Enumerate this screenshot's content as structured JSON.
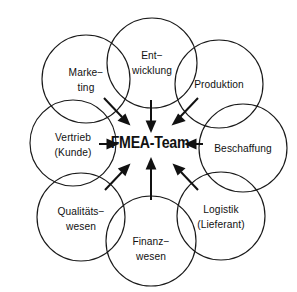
{
  "diagram": {
    "title": "FMEA-Team",
    "center": {
      "label": "FMEA-Team",
      "name": "center-node"
    },
    "style": {
      "background_color": "#ffffff",
      "stroke_color": "#1a1a1a",
      "arrow_color": "#111111",
      "text_color": "#111111"
    },
    "nodes": [
      {
        "id": "entwicklung",
        "lines": [
          "Ent−",
          "wicklung"
        ],
        "line1": "Ent−",
        "line2": "wicklung",
        "position": "top"
      },
      {
        "id": "produktion",
        "lines": [
          "Produktion"
        ],
        "line1": "Produktion",
        "line2": "",
        "position": "top-right"
      },
      {
        "id": "beschaffung",
        "lines": [
          "Beschaffung"
        ],
        "line1": "Beschaffung",
        "line2": "",
        "position": "right"
      },
      {
        "id": "logistik",
        "lines": [
          "Logistik",
          "(Lieferant)"
        ],
        "line1": "Logistik",
        "line2": "(Lieferant)",
        "position": "bottom-right"
      },
      {
        "id": "finanzwesen",
        "lines": [
          "Finanz−",
          "wesen"
        ],
        "line1": "Finanz−",
        "line2": "wesen",
        "position": "bottom"
      },
      {
        "id": "qualitaetswesen",
        "lines": [
          "Qualitäts−",
          "wesen"
        ],
        "line1": "Qualitäts−",
        "line2": "wesen",
        "position": "bottom-left"
      },
      {
        "id": "vertrieb",
        "lines": [
          "Vertrieb",
          "(Kunde)"
        ],
        "line1": "Vertrieb",
        "line2": "(Kunde)",
        "position": "left"
      },
      {
        "id": "marketing",
        "lines": [
          "Marke−",
          "ting"
        ],
        "line1": "Marke−",
        "line2": "ting",
        "position": "top-left"
      }
    ]
  }
}
